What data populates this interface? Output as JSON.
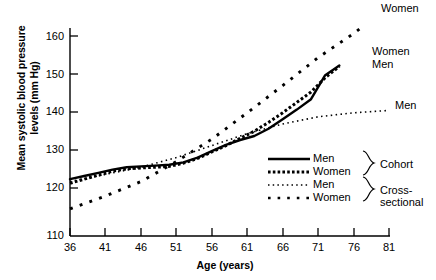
{
  "chart_data": {
    "type": "line",
    "title": "",
    "xlabel": "Age (years)",
    "ylabel": "Mean systolic blood pressure levels (mm Hg)",
    "ylabel_line1": "Mean systolic blood pressure",
    "ylabel_line2": "levels (mm Hg)",
    "xlim": [
      36,
      81
    ],
    "ylim": [
      110,
      165
    ],
    "xticks": [
      36,
      41,
      46,
      51,
      56,
      61,
      66,
      71,
      76,
      81
    ],
    "yticks": [
      110,
      120,
      130,
      140,
      150,
      160
    ],
    "grid": false,
    "legend_position": "inside-lower-right",
    "series": [
      {
        "name": "Men",
        "group": "Cohort",
        "style": "solid",
        "color": "#000000",
        "x": [
          36,
          38,
          40,
          42,
          44,
          46,
          48,
          50,
          52,
          54,
          56,
          58,
          60,
          62,
          64,
          66,
          68,
          70,
          72,
          74
        ],
        "values": [
          124.2,
          125.0,
          125.8,
          126.6,
          127.2,
          127.4,
          127.6,
          127.8,
          128.4,
          129.6,
          131.2,
          132.8,
          134.0,
          135.0,
          136.8,
          139.2,
          141.6,
          144.2,
          150.2,
          152.6
        ]
      },
      {
        "name": "Women",
        "group": "Cohort",
        "style": "thick-dotted",
        "color": "#000000",
        "x": [
          36,
          38,
          40,
          42,
          44,
          46,
          48,
          50,
          52,
          54,
          56,
          58,
          60,
          62,
          64,
          66,
          68,
          70,
          72,
          74
        ],
        "values": [
          123.2,
          124.2,
          125.2,
          126.2,
          126.8,
          127.0,
          127.2,
          127.4,
          128.2,
          129.4,
          131.0,
          132.6,
          134.4,
          136.2,
          138.4,
          140.8,
          143.4,
          146.0,
          149.6,
          152.4
        ]
      },
      {
        "name": "Men",
        "group": "Cross-sectional",
        "style": "fine-dotted",
        "color": "#000000",
        "x": [
          36,
          41,
          46,
          51,
          56,
          61,
          66,
          71,
          76,
          81
        ],
        "values": [
          123.6,
          125.4,
          127.2,
          129.6,
          132.6,
          135.6,
          138.0,
          139.8,
          140.8,
          141.4
        ]
      },
      {
        "name": "Women",
        "group": "Cross-sectional",
        "style": "spaced-dotted",
        "color": "#000000",
        "x": [
          36,
          41,
          46,
          51,
          56,
          61,
          66,
          71,
          76,
          77
        ],
        "values": [
          116.8,
          120.0,
          123.6,
          128.6,
          134.2,
          140.8,
          147.6,
          154.6,
          160.6,
          162.0
        ]
      }
    ],
    "annotations": [
      {
        "text": "Women",
        "for": "Cross-sectional Women",
        "x": 77.5,
        "y": 164.5
      },
      {
        "text": "Women",
        "for": "Cohort Women",
        "x": 75.5,
        "y": 153.8
      },
      {
        "text": "Men",
        "for": "Cohort Men",
        "x": 75.5,
        "y": 150.5
      },
      {
        "text": "Men",
        "for": "Cross-sectional Men",
        "x": 78.5,
        "y": 141.5
      }
    ],
    "legend": {
      "entries": [
        {
          "label": "Men",
          "style": "solid",
          "group": "Cohort"
        },
        {
          "label": "Women",
          "style": "thick-dotted",
          "group": "Cohort"
        },
        {
          "label": "Men",
          "style": "fine-dotted",
          "group": "Cross-sectional"
        },
        {
          "label": "Women",
          "style": "spaced-dotted",
          "group": "Cross-sectional"
        }
      ],
      "groups": [
        {
          "label": "Cohort"
        },
        {
          "label": "Cross-sectional"
        }
      ]
    }
  }
}
